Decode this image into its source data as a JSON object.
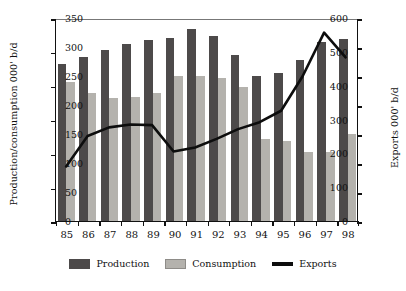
{
  "chart_data": {
    "type": "bar",
    "title": "",
    "subtitle": "",
    "categories": [
      "85",
      "86",
      "87",
      "88",
      "89",
      "90",
      "91",
      "92",
      "93",
      "94",
      "95",
      "96",
      "97",
      "98"
    ],
    "xlabel": "",
    "ylabel": "Production/consumption 000' b/d",
    "ylabel_secondary": "Exports 000' b/d",
    "ylim": [
      0,
      600
    ],
    "ylim_secondary": [
      0,
      350
    ],
    "yticks": [
      0,
      100,
      200,
      300,
      400,
      500,
      600
    ],
    "yticks_secondary": [
      0,
      50,
      100,
      150,
      200,
      250,
      300,
      350
    ],
    "grid": false,
    "legend_position": "bottom",
    "series": [
      {
        "name": "Production",
        "type": "bar",
        "axis": "left",
        "color": "#4d4a4a",
        "values": [
          463,
          486,
          505,
          524,
          534,
          540,
          568,
          548,
          490,
          430,
          438,
          477,
          530,
          539
        ]
      },
      {
        "name": "Consumption",
        "type": "bar",
        "axis": "left",
        "color": "#b4b2ad",
        "values": [
          411,
          377,
          365,
          366,
          377,
          430,
          430,
          424,
          397,
          243,
          236,
          203,
          205,
          257
        ]
      },
      {
        "name": "Exports",
        "type": "line",
        "axis": "right",
        "color": "#0d0d0d",
        "values": [
          95,
          148,
          163,
          168,
          167,
          121,
          128,
          143,
          160,
          172,
          192,
          252,
          328,
          285
        ]
      }
    ]
  },
  "legend": {
    "entries": [
      {
        "label": "Production",
        "swatch": "production-swatch"
      },
      {
        "label": "Consumption",
        "swatch": "consumption-swatch"
      },
      {
        "label": "Exports",
        "swatch": "exports-line-swatch"
      }
    ]
  }
}
